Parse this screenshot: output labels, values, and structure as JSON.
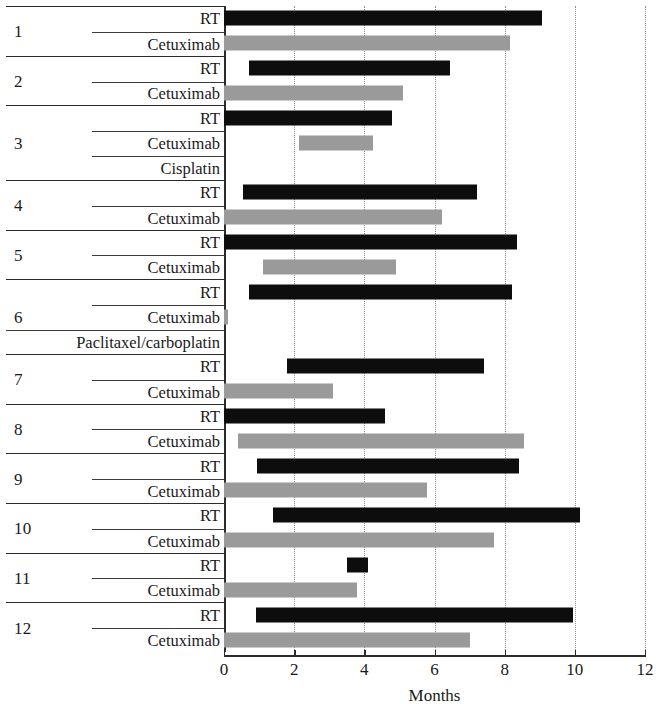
{
  "chart_data": {
    "type": "bar",
    "subtype": "gantt-timeline",
    "title": "",
    "xlabel": "Months",
    "ylabel": "",
    "xlim": [
      0,
      12
    ],
    "xticks": [
      0,
      2,
      4,
      6,
      8,
      10,
      12
    ],
    "xtick_labels": [
      "0",
      "2",
      "4",
      "6",
      "8",
      "10",
      "12"
    ],
    "grid": "vertical dotted gridlines at every tick",
    "legend": "none (bar color encodes treatment: black = RT, gray = systemic agent)",
    "colors": {
      "rt_bar": "#0d0d0d",
      "drug_bar": "#9a9a9a",
      "axis": "#2b2b2b",
      "gridline": "#8e8e8e",
      "background": "#ffffff"
    },
    "units": "months",
    "series": [
      {
        "name": "RT",
        "color": "#0d0d0d"
      },
      {
        "name": "Cetuximab",
        "color": "#9a9a9a"
      },
      {
        "name": "Cisplatin",
        "color": "#9a9a9a"
      },
      {
        "name": "Paclitaxel/carboplatin",
        "color": "#9a9a9a"
      }
    ],
    "patients": [
      {
        "id": "1",
        "treatments": [
          {
            "label": "RT",
            "start": 0.0,
            "end": 9.05,
            "color": "#0d0d0d"
          },
          {
            "label": "Cetuximab",
            "start": 0.0,
            "end": 8.15,
            "color": "#9a9a9a"
          }
        ]
      },
      {
        "id": "2",
        "treatments": [
          {
            "label": "RT",
            "start": 0.7,
            "end": 6.45,
            "color": "#0d0d0d"
          },
          {
            "label": "Cetuximab",
            "start": 0.0,
            "end": 5.1,
            "color": "#9a9a9a"
          }
        ]
      },
      {
        "id": "3",
        "treatments": [
          {
            "label": "RT",
            "start": 0.0,
            "end": 4.8,
            "color": "#0d0d0d"
          },
          {
            "label": "Cetuximab",
            "start": 2.15,
            "end": 4.25,
            "color": "#9a9a9a"
          },
          {
            "label": "Cisplatin",
            "start": 0.0,
            "end": 0.0,
            "color": "#9a9a9a"
          }
        ]
      },
      {
        "id": "4",
        "treatments": [
          {
            "label": "RT",
            "start": 0.55,
            "end": 7.2,
            "color": "#0d0d0d"
          },
          {
            "label": "Cetuximab",
            "start": 0.0,
            "end": 6.2,
            "color": "#9a9a9a"
          }
        ]
      },
      {
        "id": "5",
        "treatments": [
          {
            "label": "RT",
            "start": 0.0,
            "end": 8.35,
            "color": "#0d0d0d"
          },
          {
            "label": "Cetuximab",
            "start": 1.1,
            "end": 4.9,
            "color": "#9a9a9a"
          }
        ]
      },
      {
        "id": "6",
        "treatments": [
          {
            "label": "RT",
            "start": 0.7,
            "end": 8.2,
            "color": "#0d0d0d"
          },
          {
            "label": "Cetuximab",
            "start": 0.0,
            "end": 0.12,
            "color": "#9a9a9a"
          },
          {
            "label": "Paclitaxel/carboplatin",
            "start": 0.0,
            "end": 0.0,
            "color": "#9a9a9a"
          }
        ]
      },
      {
        "id": "7",
        "treatments": [
          {
            "label": "RT",
            "start": 1.8,
            "end": 7.4,
            "color": "#0d0d0d"
          },
          {
            "label": "Cetuximab",
            "start": 0.0,
            "end": 3.1,
            "color": "#9a9a9a"
          }
        ]
      },
      {
        "id": "8",
        "treatments": [
          {
            "label": "RT",
            "start": 0.0,
            "end": 4.6,
            "color": "#0d0d0d"
          },
          {
            "label": "Cetuximab",
            "start": 0.4,
            "end": 8.55,
            "color": "#9a9a9a"
          }
        ]
      },
      {
        "id": "9",
        "treatments": [
          {
            "label": "RT",
            "start": 0.95,
            "end": 8.4,
            "color": "#0d0d0d"
          },
          {
            "label": "Cetuximab",
            "start": 0.0,
            "end": 5.8,
            "color": "#9a9a9a"
          }
        ]
      },
      {
        "id": "10",
        "treatments": [
          {
            "label": "RT",
            "start": 1.4,
            "end": 10.15,
            "color": "#0d0d0d"
          },
          {
            "label": "Cetuximab",
            "start": 0.0,
            "end": 7.7,
            "color": "#9a9a9a"
          }
        ]
      },
      {
        "id": "11",
        "treatments": [
          {
            "label": "RT",
            "start": 3.5,
            "end": 4.1,
            "color": "#0d0d0d"
          },
          {
            "label": "Cetuximab",
            "start": 0.0,
            "end": 3.8,
            "color": "#9a9a9a"
          }
        ]
      },
      {
        "id": "12",
        "treatments": [
          {
            "label": "RT",
            "start": 0.9,
            "end": 9.95,
            "color": "#0d0d0d"
          },
          {
            "label": "Cetuximab",
            "start": 0.0,
            "end": 7.0,
            "color": "#9a9a9a"
          }
        ]
      }
    ]
  },
  "watermark": {
    "text": ""
  }
}
